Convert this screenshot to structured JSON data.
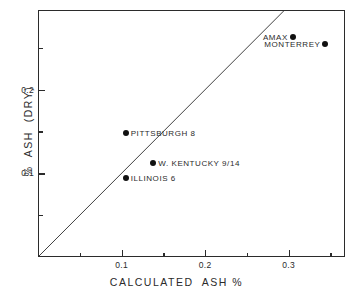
{
  "chart_data": {
    "type": "scatter",
    "title": "",
    "subtitle": "",
    "xlabel": "CALCULATED  ASH %",
    "ylabel": "%  ASH  (DRY)",
    "xlim": [
      0.0,
      0.3674
    ],
    "ylim": [
      0.0,
      0.2952
    ],
    "grid": false,
    "legend": "none",
    "x_major_ticks": [
      0.1,
      0.2,
      0.3
    ],
    "x_major_ticklabels": [
      "0.1",
      "0.2",
      "0.3"
    ],
    "x_minor_ticks": [
      0.05,
      0.15,
      0.25,
      0.35
    ],
    "y_major_ticks": [
      0.1,
      0.2
    ],
    "y_major_ticklabels": [
      "0.1",
      "0.2"
    ],
    "y_minor_ticks": [
      0.05,
      0.15,
      0.25
    ],
    "reference_line": {
      "name": "identity-line",
      "description": "1:1 line (y = x)",
      "from": [
        0.0,
        0.0
      ],
      "to": [
        0.2952,
        0.2952
      ]
    },
    "points": [
      {
        "label": "AMAX",
        "x": 0.305,
        "y": 0.263,
        "label_side": "left"
      },
      {
        "label": "MONTERREY",
        "x": 0.344,
        "y": 0.254,
        "label_side": "left"
      },
      {
        "label": "PITTSBURGH  8",
        "x": 0.105,
        "y": 0.148,
        "label_side": "right"
      },
      {
        "label": "W. KENTUCKY  9/14",
        "x": 0.138,
        "y": 0.112,
        "label_side": "right"
      },
      {
        "label": "ILLINOIS  6",
        "x": 0.105,
        "y": 0.094,
        "label_side": "right"
      }
    ],
    "colors": {
      "marker": "#111111",
      "axis": "#2b2b2b",
      "line": "#2b2b2b",
      "background": "#ffffff"
    }
  }
}
